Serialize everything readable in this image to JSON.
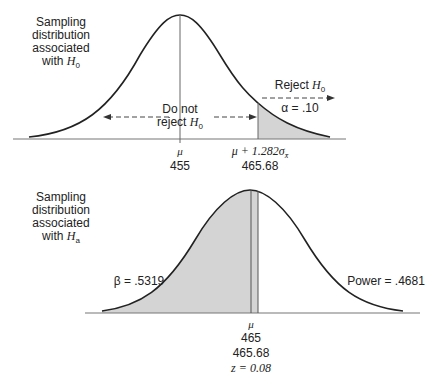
{
  "top_panel": {
    "title_lines": [
      "Sampling",
      "distribution",
      "associated"
    ],
    "title_with": "with ",
    "title_hyp": "H",
    "title_hyp_sub": "0",
    "do_not_line1": "Do not",
    "do_not_line2": "reject ",
    "do_not_hyp": "H",
    "do_not_sub": "0",
    "reject_label": "Reject ",
    "reject_hyp": "H",
    "reject_sub": "0",
    "alpha_label": "α = .10",
    "mu_symbol": "μ",
    "mu_value": "455",
    "critical_expr": "μ + 1.282σ",
    "critical_sub": "x̄",
    "critical_value": "465.68"
  },
  "bottom_panel": {
    "title_lines": [
      "Sampling",
      "distribution",
      "associated"
    ],
    "title_with": "with ",
    "title_hyp": "H",
    "title_hyp_sub": "a",
    "beta_label": "β = .5319",
    "power_label": "Power = .4681",
    "mu_symbol": "μ",
    "mu_value": "465",
    "critical_value": "465.68",
    "z_label": "z = 0.08"
  },
  "colors": {
    "shade": "#d4d4d4",
    "line": "#222222",
    "axis": "#777777"
  }
}
